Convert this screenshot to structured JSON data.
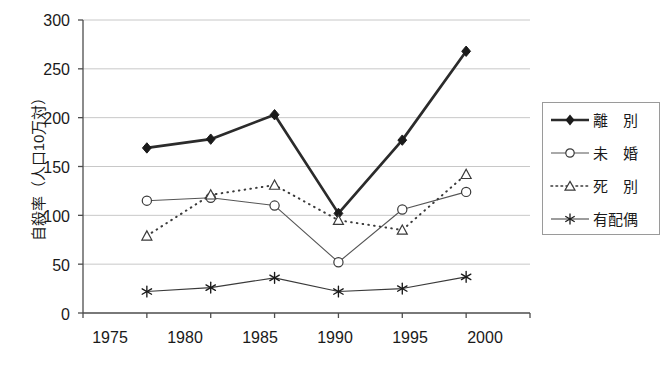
{
  "chart_data": {
    "type": "line",
    "title": "",
    "xlabel": "",
    "ylabel": "自殺率（人口10万対）",
    "categories": [
      "1975",
      "1980",
      "1985",
      "1990",
      "1995",
      "2000"
    ],
    "x": [
      1975,
      1980,
      1985,
      1990,
      1995,
      2000
    ],
    "ylim": [
      0,
      300
    ],
    "yticks": [
      0,
      50,
      100,
      150,
      200,
      250,
      300
    ],
    "ytick_labels": [
      "0",
      "50",
      "100",
      "150",
      "200",
      "250",
      "300"
    ],
    "grid": "horizontal",
    "legend_position": "right",
    "series": [
      {
        "name": "離　別",
        "marker": "filled-diamond",
        "line_style": "solid",
        "line_width": "thick",
        "color": "#2b2b2b",
        "values": [
          169,
          178,
          203,
          102,
          177,
          268
        ]
      },
      {
        "name": "未　婚",
        "marker": "open-circle",
        "line_style": "solid",
        "line_width": "thin",
        "color": "#555555",
        "values": [
          115,
          118,
          110,
          52,
          106,
          124
        ]
      },
      {
        "name": "死　別",
        "marker": "open-triangle",
        "line_style": "dotted",
        "line_width": "thin",
        "color": "#3a3a3a",
        "values": [
          79,
          121,
          131,
          95,
          85,
          142
        ]
      },
      {
        "name": "有配偶",
        "marker": "asterisk",
        "line_style": "solid",
        "line_width": "thin",
        "color": "#3a3a3a",
        "values": [
          22,
          26,
          36,
          22,
          25,
          37
        ]
      }
    ]
  },
  "legend": {
    "items": [
      {
        "label": "離　別",
        "marker": "filled-diamond",
        "style": "solid-thick"
      },
      {
        "label": "未　婚",
        "marker": "open-circle",
        "style": "solid-thin"
      },
      {
        "label": "死　別",
        "marker": "open-triangle",
        "style": "dotted-thin"
      },
      {
        "label": "有配偶",
        "marker": "asterisk",
        "style": "solid-thin"
      }
    ]
  },
  "colors": {
    "axis": "#4d4d4d",
    "grid": "#c8c8c8",
    "background": "#ffffff",
    "text": "#1a1a1a"
  }
}
